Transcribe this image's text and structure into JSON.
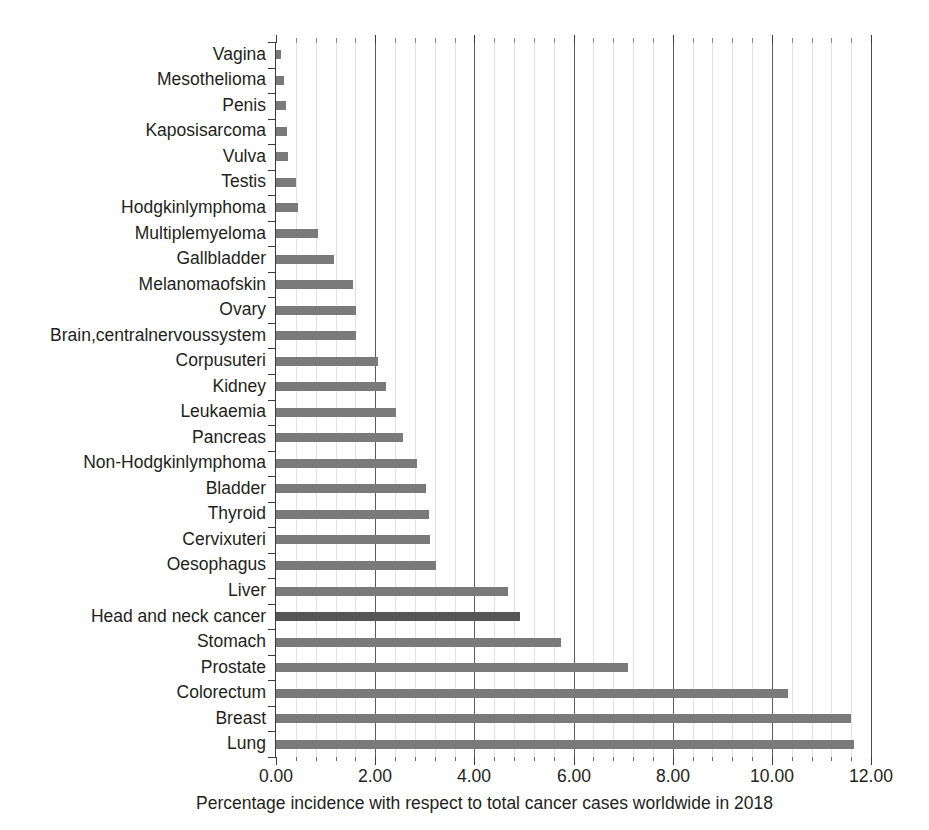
{
  "chart_data": {
    "type": "bar",
    "orientation": "horizontal",
    "title": "",
    "subtitle": "",
    "xlabel": "Percentage incidence with respect to total cancer cases worldwide in 2018",
    "ylabel": "",
    "xlim": [
      0.0,
      12.0
    ],
    "xticks": [
      0.0,
      2.0,
      4.0,
      6.0,
      8.0,
      10.0,
      12.0
    ],
    "xtick_labels": [
      "0.00",
      "2.00",
      "4.00",
      "6.00",
      "8.00",
      "10.00",
      "12.00"
    ],
    "xtick_minor_step": 0.4,
    "grid": "vertical-major-and-minor",
    "legend": "none",
    "bar_color": "#7a7a7a",
    "highlight_color": "#565656",
    "highlight_category": "Head and neck cancer",
    "categories": [
      "Vagina",
      "Mesothelioma",
      "Penis",
      "Kaposisarcoma",
      "Vulva",
      "Testis",
      "Hodgkinlymphoma",
      "Multiplemyeloma",
      "Gallbladder",
      "Melanomaofskin",
      "Ovary",
      "Brain,centralnervoussystem",
      "Corpusuteri",
      "Kidney",
      "Leukaemia",
      "Pancreas",
      "Non-Hodgkinlymphoma",
      "Bladder",
      "Thyroid",
      "Cervixuteri",
      "Oesophagus",
      "Liver",
      "Head and neck cancer",
      "Stomach",
      "Prostate",
      "Colorectum",
      "Breast",
      "Lung"
    ],
    "values": [
      0.1,
      0.17,
      0.2,
      0.23,
      0.24,
      0.4,
      0.44,
      0.85,
      1.17,
      1.55,
      1.61,
      1.62,
      2.06,
      2.21,
      2.42,
      2.56,
      2.84,
      3.02,
      3.08,
      3.1,
      3.22,
      4.68,
      4.92,
      5.75,
      7.1,
      10.32,
      11.6,
      11.65
    ]
  }
}
